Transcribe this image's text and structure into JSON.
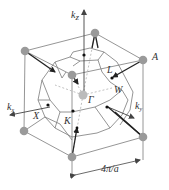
{
  "figure": {
    "labels": {
      "kz": "k",
      "kz_sub": "z",
      "kx": "k",
      "kx_sub": "x",
      "ky": "k",
      "ky_sub": "y",
      "A": "A",
      "L": "L",
      "W": "W",
      "Gamma": "Γ",
      "X": "X",
      "K": "K",
      "dimension": "4π/a"
    },
    "colors": {
      "cube_edge": "#8a8a8a",
      "zone_edge": "#7a7a7a",
      "corner_point": "#9a9a9a",
      "arrow": "#222222",
      "dashed": "#b0b0b0",
      "point": "#111111"
    }
  }
}
